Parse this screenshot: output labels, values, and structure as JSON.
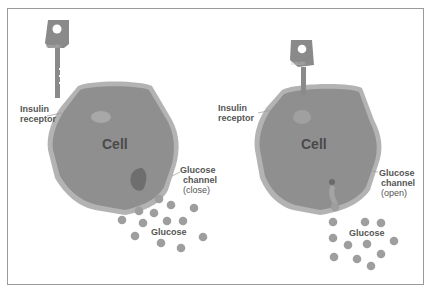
{
  "diagram": {
    "panels": [
      {
        "state": "no-insulin-bound",
        "key_label": "Insulin",
        "cell_label": "Cell",
        "receptor_label_line1": "Insulin",
        "receptor_label_line2": "receptor",
        "channel_label_line1": "Glucose",
        "channel_label_line2": "channel",
        "channel_state": "(close)",
        "glucose_label": "Glucose"
      },
      {
        "state": "insulin-bound",
        "key_label": "Insulin",
        "cell_label": "Cell",
        "receptor_label_line1": "Insulin",
        "receptor_label_line2": "receptor",
        "channel_label_line1": "Glucose",
        "channel_label_line2": "channel",
        "channel_state": "(open)",
        "glucose_label": "Glucose"
      }
    ],
    "colors": {
      "cell_fill": "#8f8f8f",
      "cell_border": "#b5b5b5",
      "glucose": "#9a9a9a",
      "key": "#8a8a8a",
      "frame": "#9a9a9a",
      "text": "#555555"
    }
  }
}
